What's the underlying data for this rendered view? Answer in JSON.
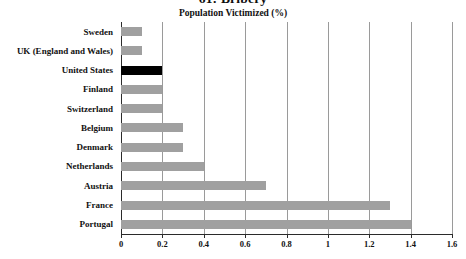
{
  "chart_data": {
    "type": "bar",
    "orientation": "horizontal",
    "title": "61: Bribery",
    "subtitle": "Population Victimized (%)",
    "xlabel": "",
    "ylabel": "",
    "xlim": [
      0,
      1.6
    ],
    "xticks": [
      "0",
      "0.2",
      "0.4",
      "0.6",
      "0.8",
      "1",
      "1.2",
      "1.4",
      "1.6"
    ],
    "xtick_values": [
      0,
      0.2,
      0.4,
      0.6,
      0.8,
      1,
      1.2,
      1.4,
      1.6
    ],
    "grid": "vertical",
    "legend": "none",
    "bar_color": "#a0a0a0",
    "highlight_color": "#000000",
    "highlight_category": "United States",
    "categories": [
      "Sweden",
      "UK (England and Wales)",
      "United States",
      "Finland",
      "Switzerland",
      "Belgium",
      "Denmark",
      "Netherlands",
      "Austria",
      "France",
      "Portugal"
    ],
    "values": [
      0.1,
      0.1,
      0.2,
      0.2,
      0.2,
      0.3,
      0.3,
      0.4,
      0.7,
      1.3,
      1.4
    ],
    "bars": [
      {
        "label": "Sweden",
        "value": 0.1,
        "highlight": false
      },
      {
        "label": "UK (England and Wales)",
        "value": 0.1,
        "highlight": false
      },
      {
        "label": "United States",
        "value": 0.2,
        "highlight": true
      },
      {
        "label": "Finland",
        "value": 0.2,
        "highlight": false
      },
      {
        "label": "Switzerland",
        "value": 0.2,
        "highlight": false
      },
      {
        "label": "Belgium",
        "value": 0.3,
        "highlight": false
      },
      {
        "label": "Denmark",
        "value": 0.3,
        "highlight": false
      },
      {
        "label": "Netherlands",
        "value": 0.4,
        "highlight": false
      },
      {
        "label": "Austria",
        "value": 0.7,
        "highlight": false
      },
      {
        "label": "France",
        "value": 1.3,
        "highlight": false
      },
      {
        "label": "Portugal",
        "value": 1.4,
        "highlight": false
      }
    ]
  }
}
